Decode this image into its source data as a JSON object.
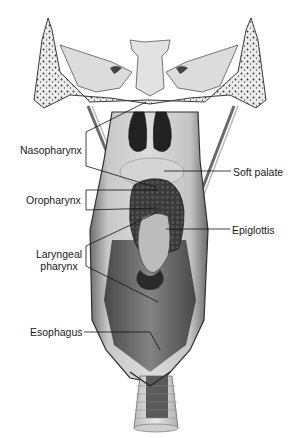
{
  "diagram": {
    "labels": {
      "nasopharynx": "Nasopharynx",
      "oropharynx": "Oropharynx",
      "laryngeal_line1": "Laryngeal",
      "laryngeal_line2": "pharynx",
      "esophagus": "Esophagus",
      "soft_palate": "Soft palate",
      "epiglottis": "Epiglottis"
    },
    "colors": {
      "bone": "#e6e6e6",
      "bone_outline": "#3a3a3a",
      "cavity_dark": "#2a2a2a",
      "wall_mid": "#9a9a9a",
      "wall_light": "#d0d0d0",
      "leader_line": "#111111"
    }
  }
}
